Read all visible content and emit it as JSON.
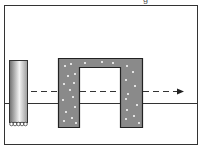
{
  "diagram": {
    "type": "schematic",
    "elements": [
      {
        "id": "frame",
        "label": "outer boundary"
      },
      {
        "id": "baseline",
        "label": "horizontal reference line"
      },
      {
        "id": "cylinder",
        "label": "vertical cylinder with rollers"
      },
      {
        "id": "arch",
        "label": "inverted U-shaped dotted block"
      },
      {
        "id": "path-arrow",
        "label": "dashed arrow left to right"
      }
    ],
    "top_glyph": "g"
  },
  "colors": {
    "frame": "#333333",
    "arch_fill": "#8a8a8a",
    "arch_dots": "#ffffff",
    "cylinder_dark": "#6e6e6e",
    "cylinder_light": "#f2f2f2",
    "line": "#333333"
  }
}
